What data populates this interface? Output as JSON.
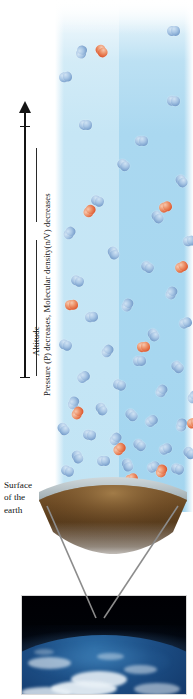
{
  "figure": {
    "axis": {
      "arrow_label": "Altitude",
      "secondary_label": "Pressure (P) decreases, Molecular density(n/V) decreases",
      "direction": "up"
    },
    "surface_caption": {
      "line1": "Surface",
      "line2": "of the",
      "line3": "earth"
    },
    "colors": {
      "column_left": "#c6e6f5",
      "column_right": "#a7d7f0",
      "molecule_blue": "#7ea4cf",
      "molecule_red": "#df5f36",
      "earth_crust": "#6b4a27",
      "surface_haze": "#b9c3c6",
      "space": "#000208",
      "ocean": "#1d4f86",
      "cloud": "#e9f1f7",
      "axis": "#141414",
      "callout_line": "#8c8c8c"
    },
    "legend_concept": {
      "blue_molecule": "nitrogen-molecule",
      "red_molecule": "oxygen-molecule"
    }
  },
  "chart_data": {
    "type": "scatter",
    "xlabel": "",
    "ylabel": "Altitude",
    "annotations": [
      "Altitude",
      "Pressure (P) decreases, Molecular density(n/V) decreases",
      "Surface of the earth"
    ],
    "legend": [
      {
        "name": "blue diatomic molecule",
        "color": "#7ea4cf"
      },
      {
        "name": "red diatomic molecule",
        "color": "#df5f36"
      }
    ],
    "grid": false,
    "series": [
      {
        "name": "blue diatomic molecule",
        "color": "#7ea4cf",
        "points": [
          [
            112,
            26
          ],
          [
            20,
            47
          ],
          [
            4,
            72
          ],
          [
            112,
            96
          ],
          [
            24,
            120
          ],
          [
            80,
            136
          ],
          [
            62,
            160
          ],
          [
            120,
            176
          ],
          [
            36,
            196
          ],
          [
            96,
            212
          ],
          [
            8,
            228
          ],
          [
            128,
            236
          ],
          [
            52,
            248
          ],
          [
            86,
            262
          ],
          [
            16,
            276
          ],
          [
            110,
            288
          ],
          [
            66,
            300
          ],
          [
            30,
            312
          ],
          [
            124,
            318
          ],
          [
            92,
            330
          ],
          [
            4,
            340
          ],
          [
            46,
            346
          ],
          [
            78,
            356
          ],
          [
            116,
            362
          ],
          [
            22,
            372
          ],
          [
            58,
            380
          ],
          [
            100,
            386
          ],
          [
            132,
            392
          ],
          [
            12,
            398
          ],
          [
            40,
            404
          ],
          [
            70,
            410
          ],
          [
            90,
            416
          ],
          [
            120,
            420
          ],
          [
            2,
            424
          ],
          [
            28,
            430
          ],
          [
            54,
            434
          ],
          [
            78,
            440
          ],
          [
            104,
            444
          ],
          [
            128,
            448
          ],
          [
            16,
            452
          ],
          [
            42,
            456
          ],
          [
            66,
            460
          ],
          [
            92,
            462
          ],
          [
            116,
            464
          ],
          [
            6,
            466
          ]
        ]
      },
      {
        "name": "red diatomic molecule",
        "color": "#df5f36",
        "points": [
          [
            40,
            46
          ],
          [
            28,
            206
          ],
          [
            104,
            202
          ],
          [
            120,
            262
          ],
          [
            10,
            300
          ],
          [
            82,
            342
          ],
          [
            16,
            408
          ],
          [
            132,
            418
          ],
          [
            58,
            444
          ],
          [
            100,
            466
          ],
          [
            70,
            474
          ]
        ]
      }
    ],
    "density_profile": {
      "note": "qualitative — molecules per unit area",
      "altitude_bins_top_to_bottom": [
        "high",
        "upper-mid",
        "lower-mid",
        "near-surface"
      ],
      "relative_density": [
        0.12,
        0.3,
        0.6,
        1.0
      ]
    }
  }
}
